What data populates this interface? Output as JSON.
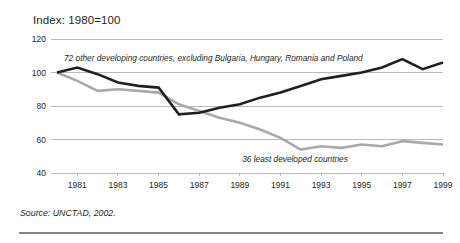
{
  "figure": {
    "title": "Index: 1980=100",
    "source_note": "Source: UNCTAD,  2002."
  },
  "chart_data": {
    "type": "line",
    "title": "Index: 1980=100",
    "xlabel": "",
    "ylabel": "",
    "ylim": [
      40,
      120
    ],
    "xlim": [
      1980,
      1999
    ],
    "grid": true,
    "gridlines_y": [
      40,
      60,
      80,
      100,
      120
    ],
    "legend_position": "inline-annotations",
    "ytick_labels": [
      "40",
      "60",
      "80",
      "100",
      "120"
    ],
    "ytick_values": [
      40,
      60,
      80,
      100,
      120
    ],
    "xtick_labels": [
      "1981",
      "1983",
      "1985",
      "1987",
      "1989",
      "1991",
      "1993",
      "1995",
      "1997",
      "1999"
    ],
    "xtick_values": [
      1981,
      1983,
      1985,
      1987,
      1989,
      1991,
      1993,
      1995,
      1997,
      1999
    ],
    "x": [
      1980,
      1981,
      1982,
      1983,
      1984,
      1985,
      1986,
      1987,
      1988,
      1989,
      1990,
      1991,
      1992,
      1993,
      1994,
      1995,
      1996,
      1997,
      1998,
      1999
    ],
    "series": [
      {
        "name": "72 other developing countries, excluding Bulgaria, Hungary, Romania and Poland",
        "color": "#231f20",
        "width": 2.6,
        "values": [
          100,
          103,
          99,
          94,
          92,
          91,
          75,
          76,
          79,
          81,
          85,
          88,
          92,
          96,
          98,
          100,
          103,
          108,
          102,
          106
        ]
      },
      {
        "name": "36 least developed countries",
        "color": "#a7a9ac",
        "width": 2.6,
        "values": [
          100,
          95,
          89,
          90,
          89,
          88,
          81,
          77,
          73,
          70,
          66,
          61,
          54,
          56,
          55,
          57,
          56,
          59,
          58,
          57
        ]
      }
    ],
    "annotations": [
      {
        "text": "72 other developing countries, excluding Bulgaria, Hungary, Romania and Poland",
        "x_px": 64,
        "y_px": 61,
        "anchor": "start"
      },
      {
        "text": "36 least developed countries",
        "x_px": 295,
        "y_px": 162,
        "anchor": "middle"
      }
    ]
  }
}
